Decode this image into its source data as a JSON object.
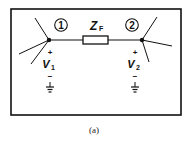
{
  "diagram": {
    "type": "circuit",
    "caption": "(a)",
    "element": {
      "name": "Z",
      "subscript": "F"
    },
    "nodes": [
      {
        "id": "1",
        "label": "1",
        "voltage": {
          "name": "V",
          "subscript": "1",
          "plus": "+",
          "minus": "−"
        }
      },
      {
        "id": "2",
        "label": "2",
        "voltage": {
          "name": "V",
          "subscript": "2",
          "plus": "+",
          "minus": "−"
        }
      }
    ],
    "colors": {
      "line": "#111111",
      "background": "#ffffff"
    }
  }
}
